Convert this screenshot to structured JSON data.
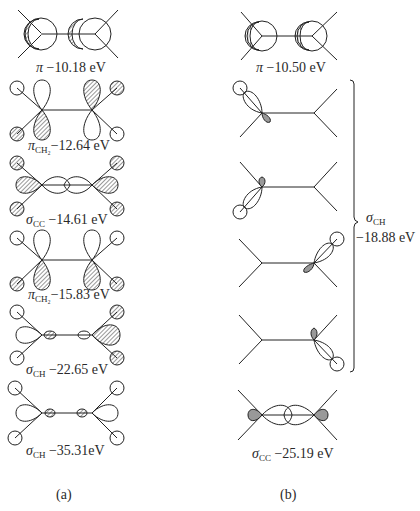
{
  "figure": {
    "panel_a": {
      "caption": "(a)",
      "orbitals": [
        {
          "symbol": "π",
          "subscript": "",
          "energy": "−10.18 eV"
        },
        {
          "symbol": "π",
          "subscript": "CH₂",
          "energy": "−12.64 eV"
        },
        {
          "symbol": "σ",
          "subscript": "CC",
          "energy": "−14.61 eV"
        },
        {
          "symbol": "π",
          "subscript": "CH₂",
          "energy": "−15.83 eV"
        },
        {
          "symbol": "σ",
          "subscript": "CH",
          "energy": "−22.65 eV"
        },
        {
          "symbol": "σ",
          "subscript": "CH",
          "energy": "−35.31eV"
        }
      ]
    },
    "panel_b": {
      "caption": "(b)",
      "orbitals": [
        {
          "symbol": "π",
          "subscript": "",
          "energy": "−10.50 eV"
        },
        {
          "symbol": "σ",
          "subscript": "CC",
          "energy": "−25.19 eV"
        }
      ],
      "bracket_group": {
        "symbol": "σ",
        "subscript": "CH",
        "energy": "−18.88 eV",
        "count": 4
      }
    }
  }
}
